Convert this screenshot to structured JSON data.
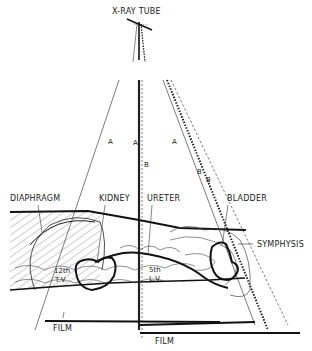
{
  "figure": {
    "title": "X-RAY TUBE",
    "ray_labels": {
      "a_left": "A",
      "a_center": "A",
      "b_center": "B",
      "a_right": "A",
      "b_right_1": "B",
      "b_right_2": "B"
    },
    "anatomy_labels": {
      "diaphragm": "DIAPHRAGM",
      "kidney": "KIDNEY",
      "ureter": "URETER",
      "bladder": "BLADDER",
      "symphysis": "SYMPHYSIS",
      "vertebra_12th": "12th",
      "vertebra_12th_sub": "T.V.",
      "vertebra_5th": "5th",
      "vertebra_5th_sub": "L.V."
    },
    "film_labels": {
      "film_upper": "FILM",
      "film_lower": "FILM"
    },
    "colors": {
      "ink": "#1a1a1a",
      "background": "#ffffff"
    }
  }
}
